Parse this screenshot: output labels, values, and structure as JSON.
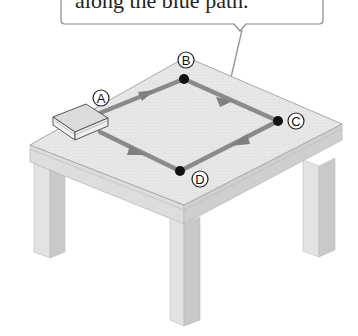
{
  "callout": {
    "text": "along the blue path."
  },
  "points": [
    {
      "id": "A",
      "label": "A"
    },
    {
      "id": "B",
      "label": "B"
    },
    {
      "id": "C",
      "label": "C"
    },
    {
      "id": "D",
      "label": "D"
    }
  ],
  "colors": {
    "path": "#8a8a8a",
    "dot": "#111111",
    "tabletop": "#e6e6e6",
    "apron": "#d2d2d2",
    "leg_light": "#e2e2e2",
    "leg_dark": "#c4c4c4",
    "book_cover": "#d9d9d9",
    "book_edge": "#555555"
  }
}
